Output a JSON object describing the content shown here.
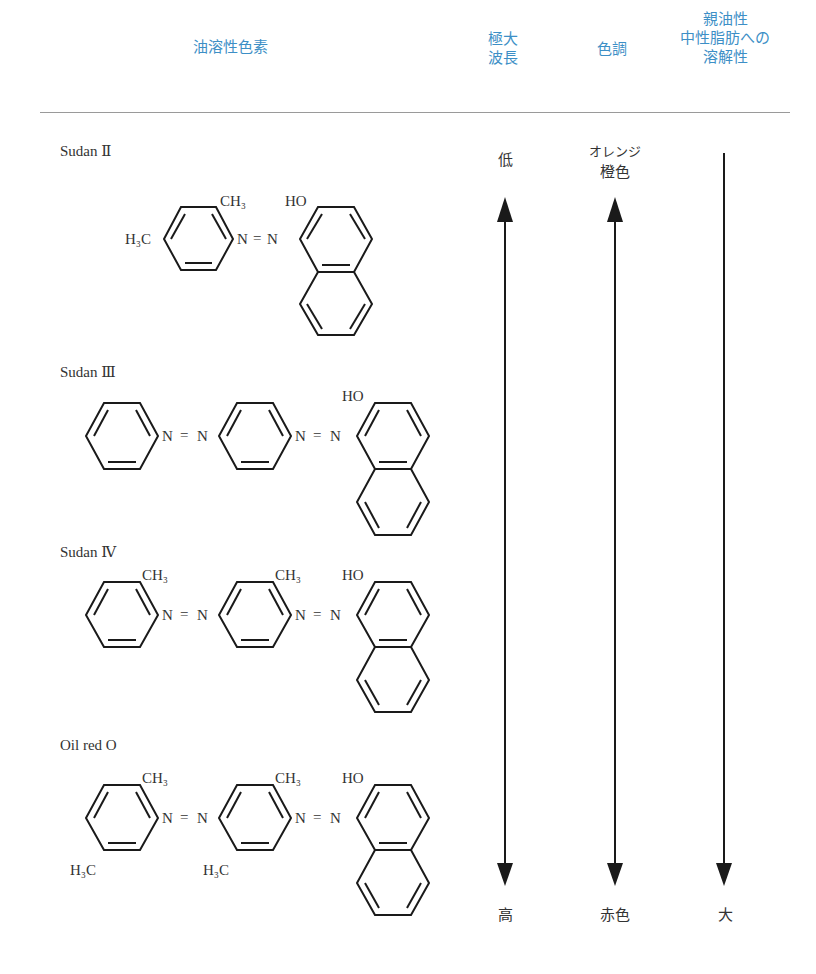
{
  "header": {
    "col_dye": "油溶性色素",
    "col_wavelength_line1": "極大",
    "col_wavelength_line2": "波長",
    "col_tone": "色調",
    "col_lipo_line1": "親油性",
    "col_lipo_line2": "中性脂肪への",
    "col_lipo_line3": "溶解性"
  },
  "dyes": [
    {
      "name": "Sudan Ⅱ",
      "substituents": [
        "CH3",
        "H3C",
        "HO"
      ],
      "azo": [
        "N=N"
      ]
    },
    {
      "name": "Sudan Ⅲ",
      "substituents": [
        "HO"
      ],
      "azo": [
        "N=N",
        "N=N"
      ]
    },
    {
      "name": "Sudan Ⅳ",
      "substituents": [
        "CH3",
        "CH3",
        "HO"
      ],
      "azo": [
        "N=N",
        "N=N"
      ]
    },
    {
      "name": "Oil red O",
      "substituents": [
        "CH3",
        "CH3",
        "HO",
        "H3C",
        "H3C"
      ],
      "azo": [
        "N=N",
        "N=N"
      ]
    }
  ],
  "scales": {
    "wavelength": {
      "top": "低",
      "bottom": "高"
    },
    "tone": {
      "top_line1": "オレンジ",
      "top_line2": "橙色",
      "bottom": "赤色"
    },
    "lipophilicity": {
      "bottom": "大"
    }
  },
  "chem_labels": {
    "ch3": "CH₃",
    "h3c": "H₃C",
    "ho": "HO",
    "n": "N",
    "eq": "="
  },
  "colors": {
    "header": "#3d8fc6",
    "ink": "#1a1a1a",
    "rule": "#9a9a9a"
  }
}
